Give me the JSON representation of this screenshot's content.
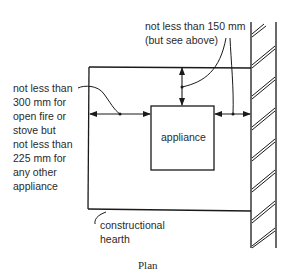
{
  "diagram": {
    "caption": "Plan",
    "labels": {
      "top_clearance": "not less than 150 mm\n(but see above)",
      "side_clearance": "not less than\n300 mm for\nopen fire or\nstove but\nnot less than\n225 mm for\nany other\nappliance",
      "appliance": "appliance",
      "hearth": "constructional\nhearth"
    },
    "elements": [
      "constructional hearth outline",
      "appliance box",
      "wall (hatched)",
      "dimension arrows"
    ],
    "colors": {
      "line": "#1a1a1a",
      "background": "#ffffff"
    }
  }
}
